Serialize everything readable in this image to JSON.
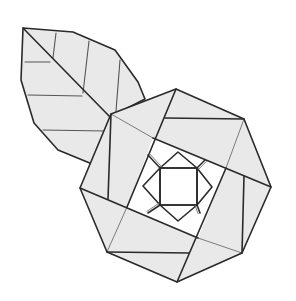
{
  "figure": {
    "colors": {
      "paper_fill": "#e9e9e9",
      "line_dark": "#2a2a2a",
      "line_light": "#6e6e6e",
      "background": "#ffffff"
    },
    "leaf": {
      "outline": [
        [
          23,
          28
        ],
        [
          73,
          32
        ],
        [
          115,
          50
        ],
        [
          138,
          82
        ],
        [
          145,
          99
        ],
        [
          110,
          117
        ],
        [
          97,
          166
        ],
        [
          58,
          150
        ],
        [
          34,
          123
        ],
        [
          21,
          80
        ]
      ],
      "midrib": [
        [
          23,
          28
        ],
        [
          110,
          117
        ]
      ],
      "veins": [
        [
          [
            25,
            62
          ],
          [
            50,
            62
          ]
        ],
        [
          [
            56,
            33
          ],
          [
            53,
            58
          ]
        ],
        [
          [
            28,
            95
          ],
          [
            82,
            96
          ]
        ],
        [
          [
            89,
            41
          ],
          [
            83,
            93
          ]
        ],
        [
          [
            43,
            130
          ],
          [
            105,
            131
          ]
        ],
        [
          [
            120,
            60
          ],
          [
            116,
            111
          ]
        ]
      ]
    },
    "rose": {
      "octagon": [
        [
          176,
          89
        ],
        [
          244,
          119
        ],
        [
          271,
          187
        ],
        [
          242,
          253
        ],
        [
          177,
          282
        ],
        [
          107,
          252
        ],
        [
          80,
          188
        ],
        [
          111,
          114
        ]
      ],
      "pinwheel_bold": [
        [
          [
            176,
            89
          ],
          [
            127,
            207
          ]
        ],
        [
          [
            80,
            188
          ],
          [
            198,
            238
          ]
        ],
        [
          [
            177,
            282
          ],
          [
            226,
            168
          ]
        ],
        [
          [
            271,
            187
          ],
          [
            153,
            138
          ]
        ]
      ],
      "extra_bold": [
        [
          [
            111,
            114
          ],
          [
            108,
            199
          ]
        ],
        [
          [
            244,
            119
          ],
          [
            165,
            118
          ]
        ],
        [
          [
            244,
            176
          ],
          [
            242,
            253
          ]
        ],
        [
          [
            107,
            252
          ],
          [
            189,
            253
          ]
        ]
      ],
      "thin": [
        [
          [
            111,
            114
          ],
          [
            153,
            138
          ]
        ],
        [
          [
            244,
            119
          ],
          [
            226,
            168
          ]
        ],
        [
          [
            242,
            253
          ],
          [
            198,
            238
          ]
        ],
        [
          [
            107,
            252
          ],
          [
            127,
            207
          ]
        ]
      ],
      "inner_tilted_square": [
        [
          153,
          138
        ],
        [
          226,
          168
        ],
        [
          198,
          238
        ],
        [
          127,
          207
        ]
      ],
      "center_square": [
        [
          160,
          168
        ],
        [
          197,
          168
        ],
        [
          197,
          205
        ],
        [
          160,
          205
        ]
      ],
      "diamonds": [
        [
          [
            160,
            168
          ],
          [
            178,
            152
          ],
          [
            197,
            168
          ]
        ],
        [
          [
            197,
            168
          ],
          [
            212,
            187
          ],
          [
            197,
            205
          ]
        ],
        [
          [
            197,
            205
          ],
          [
            178,
            221
          ],
          [
            160,
            205
          ]
        ],
        [
          [
            160,
            205
          ],
          [
            143,
            186
          ],
          [
            160,
            168
          ]
        ]
      ],
      "corner_connectors": [
        [
          [
            160,
            168
          ],
          [
            148,
            155
          ]
        ],
        [
          [
            197,
            168
          ],
          [
            205,
            160
          ]
        ],
        [
          [
            197,
            205
          ],
          [
            200,
            213
          ]
        ],
        [
          [
            160,
            205
          ],
          [
            148,
            213
          ]
        ]
      ]
    }
  }
}
